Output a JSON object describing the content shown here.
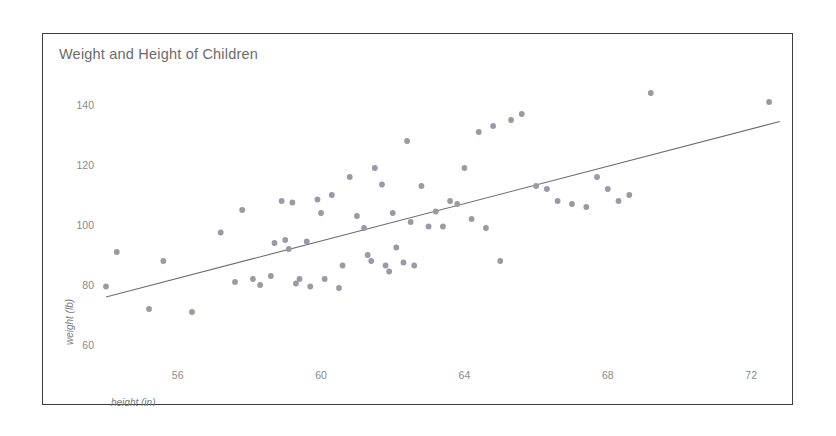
{
  "chart_data": {
    "type": "scatter",
    "title": "Weight and Height of Children",
    "xlabel": "height (in)",
    "ylabel": "weight (lb)",
    "xlim": [
      54.0,
      73.0
    ],
    "ylim": [
      57.0,
      147.0
    ],
    "xticks": [
      56,
      60,
      64,
      68,
      72
    ],
    "yticks": [
      60,
      80,
      100,
      120,
      140
    ],
    "grid": false,
    "legend": null,
    "x": [
      54.0,
      54.3,
      55.2,
      55.6,
      56.4,
      57.2,
      57.6,
      57.8,
      58.1,
      58.3,
      58.6,
      58.7,
      58.9,
      59.0,
      59.1,
      59.2,
      59.3,
      59.4,
      59.6,
      59.7,
      59.9,
      60.0,
      60.1,
      60.3,
      60.5,
      60.6,
      60.8,
      61.0,
      61.2,
      61.3,
      61.4,
      61.5,
      61.7,
      61.8,
      61.9,
      62.0,
      62.1,
      62.3,
      62.4,
      62.5,
      62.6,
      62.8,
      63.0,
      63.2,
      63.4,
      63.6,
      63.8,
      64.0,
      64.2,
      64.4,
      64.6,
      64.8,
      65.0,
      65.3,
      65.6,
      66.0,
      66.3,
      66.6,
      67.0,
      67.4,
      67.7,
      68.0,
      68.3,
      68.6,
      69.2,
      72.5
    ],
    "y": [
      79.5,
      91.0,
      72.0,
      88.0,
      71.0,
      97.5,
      81.0,
      105.0,
      82.0,
      80.0,
      83.0,
      94.0,
      108.0,
      95.0,
      92.0,
      107.5,
      80.5,
      82.0,
      94.5,
      79.5,
      108.5,
      104.0,
      82.0,
      110.0,
      79.0,
      86.5,
      116.0,
      103.0,
      99.0,
      90.0,
      88.0,
      119.0,
      113.5,
      86.5,
      84.5,
      104.0,
      92.5,
      87.5,
      128.0,
      101.0,
      86.5,
      113.0,
      99.5,
      104.5,
      99.5,
      108.0,
      107.0,
      119.0,
      102.0,
      131.0,
      99.0,
      133.0,
      88.0,
      135.0,
      137.0,
      113.0,
      112.0,
      108.0,
      107.0,
      106.0,
      116.0,
      112.0,
      108.0,
      110.0,
      144.0,
      141.0
    ],
    "trend_line": {
      "x": [
        54.0,
        72.8
      ],
      "y": [
        76.0,
        134.5
      ],
      "style": "solid"
    }
  }
}
